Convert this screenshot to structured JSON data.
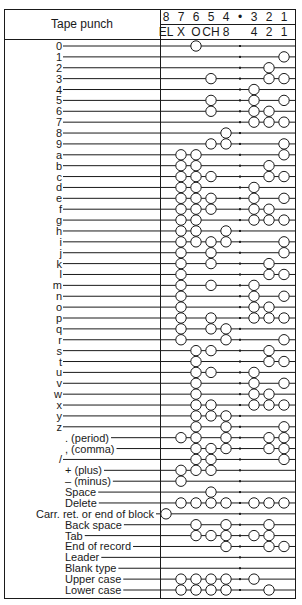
{
  "title": "Tape punch",
  "header": {
    "channels": [
      "8",
      "7",
      "6",
      "5",
      "4",
      "•",
      "3",
      "2",
      "1"
    ],
    "codes": [
      "EL",
      "X",
      "O",
      "CH",
      "8",
      "",
      "4",
      "2",
      "1"
    ]
  },
  "columns_x": {
    "8": 166,
    "7": 181,
    "6": 196,
    "5": 211,
    "4": 226,
    "sprocket": 240,
    "3": 254,
    "2": 269,
    "1": 284
  },
  "colors": {
    "ink": "#1a1a1a",
    "background": "#ffffff"
  },
  "chart_data": {
    "type": "table",
    "title": "Tape punch",
    "channels": [
      "8",
      "7",
      "6",
      "5",
      "4",
      "3",
      "2",
      "1"
    ],
    "channel_codes": {
      "8": "EL",
      "7": "X",
      "6": "O",
      "5": "CH",
      "4": "8",
      "3": "4",
      "2": "2",
      "1": "1"
    },
    "rows": [
      {
        "label": "0",
        "holes": [
          6
        ]
      },
      {
        "label": "1",
        "holes": [
          1
        ]
      },
      {
        "label": "2",
        "holes": [
          2
        ]
      },
      {
        "label": "3",
        "holes": [
          5,
          2,
          1
        ]
      },
      {
        "label": "4",
        "holes": [
          3
        ]
      },
      {
        "label": "5",
        "holes": [
          5,
          3,
          1
        ]
      },
      {
        "label": "6",
        "holes": [
          5,
          3,
          2
        ]
      },
      {
        "label": "7",
        "holes": [
          3,
          2,
          1
        ]
      },
      {
        "label": "8",
        "holes": [
          4
        ]
      },
      {
        "label": "9",
        "holes": [
          5,
          4,
          1
        ]
      },
      {
        "label": "a",
        "holes": [
          7,
          6,
          1
        ]
      },
      {
        "label": "b",
        "holes": [
          7,
          6,
          2
        ]
      },
      {
        "label": "c",
        "holes": [
          7,
          6,
          5,
          2,
          1
        ]
      },
      {
        "label": "d",
        "holes": [
          7,
          6,
          3
        ]
      },
      {
        "label": "e",
        "holes": [
          7,
          6,
          5,
          3,
          1
        ]
      },
      {
        "label": "f",
        "holes": [
          7,
          6,
          5,
          3,
          2
        ]
      },
      {
        "label": "g",
        "holes": [
          7,
          6,
          3,
          2,
          1
        ]
      },
      {
        "label": "h",
        "holes": [
          7,
          6,
          4
        ]
      },
      {
        "label": "i",
        "holes": [
          7,
          6,
          5,
          4,
          1
        ]
      },
      {
        "label": "j",
        "holes": [
          7,
          5,
          1
        ]
      },
      {
        "label": "k",
        "holes": [
          7,
          5,
          2
        ]
      },
      {
        "label": "l",
        "holes": [
          7,
          2,
          1
        ]
      },
      {
        "label": "m",
        "holes": [
          7,
          5,
          3
        ]
      },
      {
        "label": "n",
        "holes": [
          7,
          3,
          1
        ]
      },
      {
        "label": "o",
        "holes": [
          7,
          3,
          2
        ]
      },
      {
        "label": "p",
        "holes": [
          7,
          5,
          3,
          2,
          1
        ]
      },
      {
        "label": "q",
        "holes": [
          7,
          5,
          4
        ]
      },
      {
        "label": "r",
        "holes": [
          7,
          4,
          1
        ]
      },
      {
        "label": "s",
        "holes": [
          6,
          5,
          2
        ]
      },
      {
        "label": "t",
        "holes": [
          6,
          2,
          1
        ]
      },
      {
        "label": "u",
        "holes": [
          6,
          5,
          3
        ]
      },
      {
        "label": "v",
        "holes": [
          6,
          3,
          1
        ]
      },
      {
        "label": "w",
        "holes": [
          6,
          3,
          2
        ]
      },
      {
        "label": "x",
        "holes": [
          6,
          5,
          3,
          2,
          1
        ]
      },
      {
        "label": "y",
        "holes": [
          6,
          5,
          4
        ]
      },
      {
        "label": "z",
        "holes": [
          6,
          4,
          1
        ]
      },
      {
        "label": ". (period)",
        "holes": [
          7,
          6,
          4,
          2,
          1
        ]
      },
      {
        "label": ", (comma)",
        "holes": [
          6,
          5,
          4,
          2,
          1
        ]
      },
      {
        "label": "/",
        "holes": [
          6,
          5,
          1
        ]
      },
      {
        "label": "+ (plus)",
        "holes": [
          7,
          6,
          5
        ]
      },
      {
        "label": "– (minus)",
        "holes": [
          7
        ]
      },
      {
        "label": "Space",
        "holes": [
          5
        ]
      },
      {
        "label": "Delete",
        "holes": [
          7,
          6,
          5,
          4,
          3,
          2,
          1
        ]
      },
      {
        "label": "Carr. ret. or end of block",
        "holes": [
          8
        ]
      },
      {
        "label": "Back space",
        "holes": [
          6,
          4,
          2
        ]
      },
      {
        "label": "Tab",
        "holes": [
          6,
          5,
          4,
          3,
          2
        ]
      },
      {
        "label": "End of record",
        "holes": [
          4,
          2,
          1
        ]
      },
      {
        "label": "Leader",
        "holes": []
      },
      {
        "label": "Blank type",
        "holes": []
      },
      {
        "label": "Upper case",
        "holes": [
          7,
          6,
          5,
          4,
          3
        ]
      },
      {
        "label": "Lower case",
        "holes": [
          7,
          6,
          5,
          4,
          2
        ]
      }
    ]
  }
}
